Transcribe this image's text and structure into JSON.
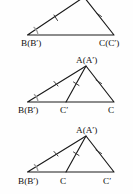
{
  "figure": {
    "background_color": "#fefefe",
    "line_color": "#1a1a1a",
    "tick_color": "#3a3a3a",
    "arc_color": "#9a9a9a",
    "panels": [
      {
        "id": "top",
        "name": "panel-top",
        "labels": {
          "apex": "",
          "base_left": "B(B′)",
          "base_right": "C(C′)",
          "base_mid": ""
        },
        "marks": {
          "angle_arc_at": "B",
          "tick_on_left_side": 1,
          "tick_on_right_side": 1,
          "cevian": false
        }
      },
      {
        "id": "middle",
        "name": "panel-middle",
        "labels": {
          "apex": "A(A′)",
          "base_left": "B(B′)",
          "base_mid": "C′",
          "base_right": "C"
        },
        "marks": {
          "angle_arc_at": "B",
          "tick_on_left_side": 1,
          "tick_on_cevian": 1,
          "tick_on_right_side": 1,
          "cevian": true,
          "cevian_to": "C′"
        }
      },
      {
        "id": "bottom",
        "name": "panel-bottom",
        "labels": {
          "apex": "A(A′)",
          "base_left": "B(B′)",
          "base_mid": "C",
          "base_right": "C′"
        },
        "marks": {
          "angle_arc_at": "B",
          "tick_on_left_side": 1,
          "tick_on_cevian": 1,
          "tick_on_right_side": 1,
          "cevian": true,
          "cevian_to": "C"
        }
      }
    ]
  }
}
